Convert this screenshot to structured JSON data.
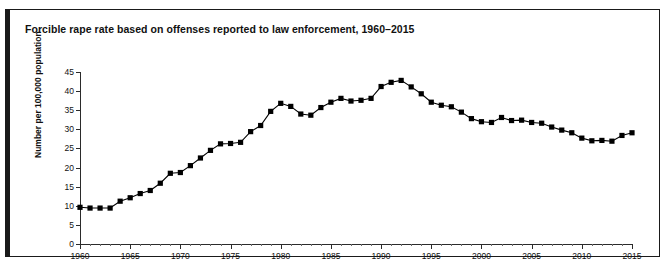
{
  "figure": {
    "label": "FIGURE 11",
    "title": "Forcible rape rate based on offenses reported to law enforcement, 1960–2015"
  },
  "chart_data": {
    "type": "line",
    "title": "Forcible rape rate based on offenses reported to law enforcement, 1960–2015",
    "xlabel": "",
    "ylabel": "Number per 100,000 population",
    "xlim": [
      1960,
      2015
    ],
    "ylim": [
      0,
      45
    ],
    "ytick_step": 5,
    "xtick_step": 5,
    "minor_xtick_step": 1,
    "grid": false,
    "legend": null,
    "marker": "square",
    "marker_color": "#000000",
    "line_color": "#000000",
    "y_ticks": [
      0,
      5,
      10,
      15,
      20,
      25,
      30,
      35,
      40,
      45
    ],
    "y_tick_labels": [
      "0",
      "5",
      "10",
      "15",
      "20",
      "25",
      "30",
      "35",
      "40",
      "45"
    ],
    "x_ticks": [
      1960,
      1965,
      1970,
      1975,
      1980,
      1985,
      1990,
      1995,
      2000,
      2005,
      2010,
      2015
    ],
    "x_tick_labels": [
      "1960",
      "1965",
      "1970",
      "1975",
      "1980",
      "1985",
      "1990",
      "1995",
      "2000",
      "2005",
      "2010",
      "2015"
    ],
    "x": [
      1960,
      1961,
      1962,
      1963,
      1964,
      1965,
      1966,
      1967,
      1968,
      1969,
      1970,
      1971,
      1972,
      1973,
      1974,
      1975,
      1976,
      1977,
      1978,
      1979,
      1980,
      1981,
      1982,
      1983,
      1984,
      1985,
      1986,
      1987,
      1988,
      1989,
      1990,
      1991,
      1992,
      1993,
      1994,
      1995,
      1996,
      1997,
      1998,
      1999,
      2000,
      2001,
      2002,
      2003,
      2004,
      2005,
      2006,
      2007,
      2008,
      2009,
      2010,
      2011,
      2012,
      2013,
      2014,
      2015
    ],
    "values": [
      9.6,
      9.4,
      9.4,
      9.4,
      11.2,
      12.1,
      13.2,
      14.0,
      15.9,
      18.5,
      18.7,
      20.5,
      22.5,
      24.5,
      26.2,
      26.3,
      26.6,
      29.4,
      31.0,
      34.7,
      36.8,
      36.0,
      34.0,
      33.7,
      35.7,
      37.1,
      38.1,
      37.4,
      37.6,
      38.1,
      41.2,
      42.3,
      42.8,
      41.1,
      39.3,
      37.1,
      36.3,
      35.9,
      34.5,
      32.8,
      32.0,
      31.8,
      33.1,
      32.3,
      32.4,
      31.8,
      31.6,
      30.6,
      29.8,
      29.1,
      27.7,
      27.0,
      27.1,
      26.9,
      28.4,
      29.1
    ],
    "annotations": []
  }
}
